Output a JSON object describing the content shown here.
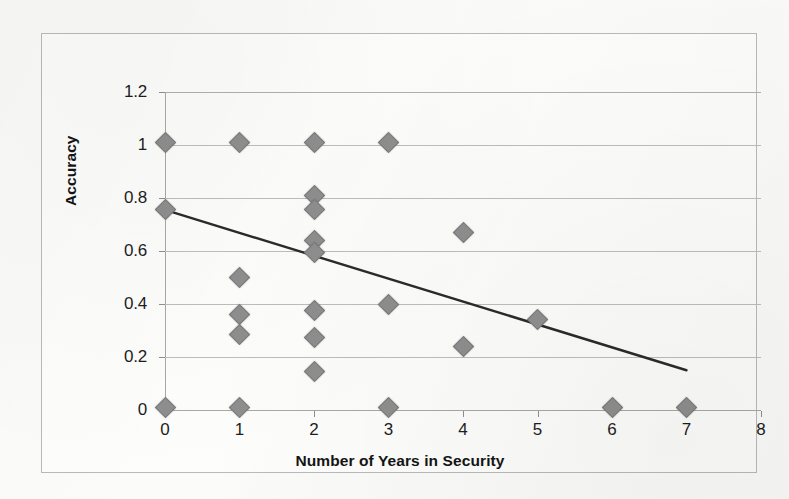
{
  "chart_data": {
    "type": "scatter",
    "title": "",
    "xlabel": "Number of Years in Security",
    "ylabel": "Accuracy",
    "xlim": [
      0,
      8
    ],
    "ylim": [
      0,
      1.2
    ],
    "grid": true,
    "legend": false,
    "xticks": [
      "0",
      "1",
      "2",
      "3",
      "4",
      "5",
      "6",
      "7",
      "8"
    ],
    "xtick_values": [
      0,
      1,
      2,
      3,
      4,
      5,
      6,
      7,
      8
    ],
    "yticks": [
      "0",
      "0.2",
      "0.4",
      "0.6",
      "0.8",
      "1",
      "1.2"
    ],
    "ytick_values": [
      0,
      0.2,
      0.4,
      0.6,
      0.8,
      1.0,
      1.2
    ],
    "series": [
      {
        "name": "Accuracy by years in security",
        "marker": "diamond",
        "color": "#8e8e8e",
        "points": [
          {
            "x": 0,
            "y": 1.01
          },
          {
            "x": 0,
            "y": 0.755
          },
          {
            "x": 0,
            "y": 0.01
          },
          {
            "x": 1,
            "y": 1.01
          },
          {
            "x": 1,
            "y": 0.5
          },
          {
            "x": 1,
            "y": 0.36
          },
          {
            "x": 1,
            "y": 0.285
          },
          {
            "x": 1,
            "y": 0.01
          },
          {
            "x": 2,
            "y": 1.01
          },
          {
            "x": 2,
            "y": 0.81
          },
          {
            "x": 2,
            "y": 0.755
          },
          {
            "x": 2,
            "y": 0.64
          },
          {
            "x": 2,
            "y": 0.595
          },
          {
            "x": 2,
            "y": 0.375
          },
          {
            "x": 2,
            "y": 0.275
          },
          {
            "x": 2,
            "y": 0.145
          },
          {
            "x": 3,
            "y": 1.01
          },
          {
            "x": 3,
            "y": 0.4
          },
          {
            "x": 3,
            "y": 0.01
          },
          {
            "x": 4,
            "y": 0.67
          },
          {
            "x": 4,
            "y": 0.24
          },
          {
            "x": 5,
            "y": 0.34
          },
          {
            "x": 6,
            "y": 0.01
          },
          {
            "x": 7,
            "y": 0.01
          }
        ]
      }
    ],
    "trendline": {
      "name": "linear-trendline",
      "color": "#2b2b2b",
      "x_start": 0,
      "y_start": 0.755,
      "x_end": 7,
      "y_end": 0.15
    }
  }
}
